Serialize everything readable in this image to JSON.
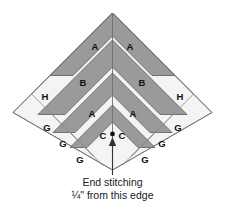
{
  "figure": {
    "name": "quilt-block-piecing-diagram",
    "colors": {
      "dark_fabric": "#9a9a9a",
      "light_fabric": "#f4f4f2",
      "outline": "#555555",
      "seam_line": "#6f6f6f",
      "background": "#ffffff",
      "text": "#1a1a1a",
      "arrow": "#333333"
    },
    "pieces": [
      {
        "id": "A-top-left",
        "label": "A",
        "x": 95,
        "y": 47
      },
      {
        "id": "A-top-right",
        "label": "A",
        "x": 130,
        "y": 47
      },
      {
        "id": "B-left",
        "label": "B",
        "x": 83,
        "y": 83
      },
      {
        "id": "B-right",
        "label": "B",
        "x": 142,
        "y": 83
      },
      {
        "id": "H-left",
        "label": "H",
        "x": 45,
        "y": 97
      },
      {
        "id": "H-right",
        "label": "H",
        "x": 180,
        "y": 97
      },
      {
        "id": "A-mid-left",
        "label": "A",
        "x": 92,
        "y": 114
      },
      {
        "id": "A-mid-right",
        "label": "A",
        "x": 133,
        "y": 114
      },
      {
        "id": "G-left-1",
        "label": "G",
        "x": 47,
        "y": 128
      },
      {
        "id": "G-right-1",
        "label": "G",
        "x": 178,
        "y": 128
      },
      {
        "id": "C-left",
        "label": "C",
        "x": 103,
        "y": 136
      },
      {
        "id": "C-right",
        "label": "C",
        "x": 122,
        "y": 136
      },
      {
        "id": "G-left-2",
        "label": "G",
        "x": 63,
        "y": 144
      },
      {
        "id": "G-right-2",
        "label": "G",
        "x": 162,
        "y": 144
      },
      {
        "id": "G-left-3",
        "label": "G",
        "x": 80,
        "y": 160
      },
      {
        "id": "G-right-3",
        "label": "G",
        "x": 145,
        "y": 160
      }
    ],
    "caption": {
      "line1": "End stitching",
      "line2": "¼\" from this edge"
    },
    "annotation": {
      "stitch_point_marker": "dot",
      "arrow": "up-arrow-to-center-point"
    }
  }
}
